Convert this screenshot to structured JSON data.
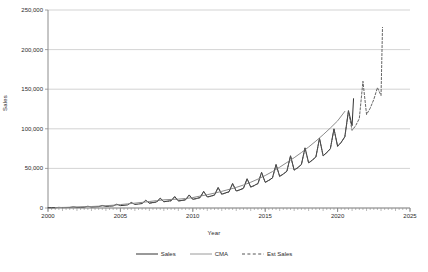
{
  "chart_data": {
    "type": "line",
    "title": "",
    "xlabel": "Year",
    "ylabel": "Sales",
    "xlim": [
      2000,
      2025
    ],
    "ylim": [
      0,
      250000
    ],
    "grid": true,
    "legend_position": "bottom",
    "y_ticks": [
      0,
      50000,
      100000,
      150000,
      200000,
      250000
    ],
    "y_tick_labels": [
      "0",
      "50,000",
      "100,000",
      "150,000",
      "200,000",
      "250,000"
    ],
    "x_ticks": [
      2000,
      2005,
      2010,
      2015,
      2020,
      2025
    ],
    "x_tick_labels": [
      "2000",
      "2005",
      "2010",
      "2015",
      "2020",
      "2025"
    ],
    "colors": {
      "sales": "#333333",
      "cma": "#8a8a8a",
      "est_sales": "#555555",
      "grid": "#c8c8c8",
      "axis": "#8c8c8c"
    },
    "series": [
      {
        "name": "Sales",
        "style": "solid",
        "color": "#333333",
        "x": [
          2000.0,
          2000.25,
          2000.5,
          2000.75,
          2001.0,
          2001.25,
          2001.5,
          2001.75,
          2002.0,
          2002.25,
          2002.5,
          2002.75,
          2003.0,
          2003.25,
          2003.5,
          2003.75,
          2004.0,
          2004.25,
          2004.5,
          2004.75,
          2005.0,
          2005.25,
          2005.5,
          2005.75,
          2006.0,
          2006.25,
          2006.5,
          2006.75,
          2007.0,
          2007.25,
          2007.5,
          2007.75,
          2008.0,
          2008.25,
          2008.5,
          2008.75,
          2009.0,
          2009.25,
          2009.5,
          2009.75,
          2010.0,
          2010.25,
          2010.5,
          2010.75,
          2011.0,
          2011.25,
          2011.5,
          2011.75,
          2012.0,
          2012.25,
          2012.5,
          2012.75,
          2013.0,
          2013.25,
          2013.5,
          2013.75,
          2014.0,
          2014.25,
          2014.5,
          2014.75,
          2015.0,
          2015.25,
          2015.5,
          2015.75,
          2016.0,
          2016.25,
          2016.5,
          2016.75,
          2017.0,
          2017.25,
          2017.5,
          2017.75,
          2018.0,
          2018.25,
          2018.5,
          2018.75,
          2019.0,
          2019.25,
          2019.5,
          2019.75,
          2020.0,
          2020.25,
          2020.5,
          2020.75,
          2021.0,
          2021.1
        ],
        "y": [
          300,
          350,
          400,
          800,
          500,
          600,
          700,
          1400,
          800,
          900,
          1100,
          2200,
          1300,
          1500,
          1700,
          3200,
          2000,
          2300,
          2600,
          4800,
          3000,
          3400,
          3900,
          7000,
          4500,
          5000,
          5600,
          9800,
          6200,
          6900,
          7600,
          12500,
          8000,
          8600,
          9200,
          14500,
          9000,
          9600,
          10400,
          16500,
          11000,
          12000,
          13200,
          21000,
          14000,
          15000,
          16500,
          26000,
          17500,
          19000,
          20500,
          31000,
          21500,
          23000,
          25000,
          37000,
          26500,
          28500,
          31000,
          45000,
          32500,
          35000,
          38000,
          55000,
          40000,
          43000,
          46500,
          66000,
          48000,
          51000,
          55000,
          76000,
          57000,
          60500,
          64500,
          88000,
          66000,
          70000,
          75000,
          100000,
          78000,
          83000,
          90000,
          123000,
          104000,
          138000
        ]
      },
      {
        "name": "CMA",
        "style": "solid",
        "color": "#8a8a8a",
        "x": [
          2000.5,
          2001.0,
          2001.5,
          2002.0,
          2002.5,
          2003.0,
          2003.5,
          2004.0,
          2004.5,
          2005.0,
          2005.5,
          2006.0,
          2006.5,
          2007.0,
          2007.5,
          2008.0,
          2008.5,
          2009.0,
          2009.5,
          2010.0,
          2010.5,
          2011.0,
          2011.5,
          2012.0,
          2012.5,
          2013.0,
          2013.5,
          2014.0,
          2014.5,
          2015.0,
          2015.5,
          2016.0,
          2016.5,
          2017.0,
          2017.5,
          2018.0,
          2018.5,
          2019.0,
          2019.5,
          2020.0,
          2020.5
        ],
        "y": [
          480,
          700,
          900,
          1200,
          1550,
          1900,
          2300,
          2900,
          3500,
          4300,
          5200,
          6100,
          7100,
          8200,
          9300,
          10300,
          10800,
          11200,
          12000,
          13200,
          15000,
          16800,
          18800,
          21000,
          23500,
          26000,
          29000,
          32500,
          36500,
          41000,
          46000,
          51500,
          57500,
          63500,
          70000,
          77000,
          84500,
          92500,
          101000,
          110000,
          122000
        ]
      },
      {
        "name": "Est Sales",
        "style": "dashed",
        "color": "#555555",
        "x": [
          2007.0,
          2007.25,
          2007.5,
          2007.75,
          2008.0,
          2008.25,
          2008.5,
          2008.75,
          2009.0,
          2009.25,
          2009.5,
          2009.75,
          2010.0,
          2010.25,
          2010.5,
          2010.75,
          2011.0,
          2011.25,
          2011.5,
          2011.75,
          2012.0,
          2012.25,
          2012.5,
          2012.75,
          2013.0,
          2013.25,
          2013.5,
          2013.75,
          2014.0,
          2014.25,
          2014.5,
          2014.75,
          2015.0,
          2015.25,
          2015.5,
          2015.75,
          2016.0,
          2016.25,
          2016.5,
          2016.75,
          2017.0,
          2017.25,
          2017.5,
          2017.75,
          2018.0,
          2018.25,
          2018.5,
          2018.75,
          2019.0,
          2019.25,
          2019.5,
          2019.75,
          2020.0,
          2020.25,
          2020.5,
          2020.75,
          2021.0,
          2021.25,
          2021.5,
          2021.75,
          2022.0,
          2022.25,
          2022.5,
          2022.75,
          2023.0,
          2023.1
        ],
        "y": [
          6000,
          6700,
          7400,
          12000,
          7800,
          8400,
          9000,
          14000,
          8800,
          9400,
          10200,
          16000,
          10800,
          11800,
          13000,
          20500,
          13800,
          14800,
          16200,
          25500,
          17200,
          18700,
          20200,
          30500,
          21200,
          22700,
          24700,
          36500,
          26200,
          28200,
          30700,
          44500,
          32200,
          34700,
          37700,
          54500,
          39700,
          42700,
          46200,
          65500,
          47700,
          50700,
          54700,
          75500,
          56700,
          60200,
          64200,
          87500,
          65700,
          69700,
          74700,
          99500,
          77700,
          82700,
          89700,
          122000,
          98000,
          104000,
          113000,
          160000,
          118000,
          126000,
          137000,
          152000,
          142000,
          228000
        ]
      }
    ]
  },
  "axis": {
    "x_title": "Year",
    "y_title": "Sales"
  },
  "legend": {
    "items": [
      {
        "label": "Sales",
        "style": "solid",
        "color": "#333333"
      },
      {
        "label": "CMA",
        "style": "solid",
        "color": "#9a9a9a"
      },
      {
        "label": "Est Sales",
        "style": "dashed",
        "color": "#555555"
      }
    ]
  }
}
